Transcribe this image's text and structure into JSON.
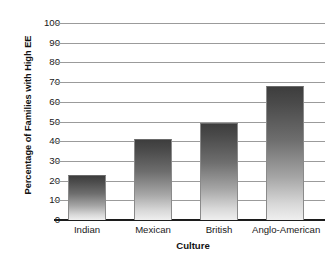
{
  "chart_data": {
    "type": "bar",
    "title": "",
    "subtitle": "",
    "xlabel": "Culture",
    "ylabel": "Percentage of Families with High EE",
    "categories": [
      "Indian",
      "Mexican",
      "British",
      "Anglo-American"
    ],
    "values": [
      23,
      41,
      49,
      68
    ],
    "series": [
      {
        "name": "Percentage of Families with High EE",
        "values": [
          23,
          41,
          49,
          68
        ]
      }
    ],
    "ylim": [
      0,
      100
    ],
    "ytick_labels": [
      "100",
      "90",
      "80",
      "70",
      "60",
      "50",
      "40",
      "30",
      "20",
      "10",
      "0"
    ],
    "ytick_values": [
      100,
      90,
      80,
      70,
      60,
      50,
      40,
      30,
      20,
      10,
      0
    ],
    "ytick_step": 10,
    "grid": true,
    "grid_axis": "y",
    "legend": false,
    "legend_position": "none",
    "annotations": [],
    "bar_fill": "vertical-gradient-dark-to-light",
    "colors": {
      "bar_top": "#3d3d3d",
      "bar_bottom": "#efefef",
      "bar_border": "#8a8a8a",
      "gridline": "#9b9b9b",
      "axis": "#1c1c1c",
      "background": "#ffffff",
      "text": "#1a1a1a"
    }
  }
}
